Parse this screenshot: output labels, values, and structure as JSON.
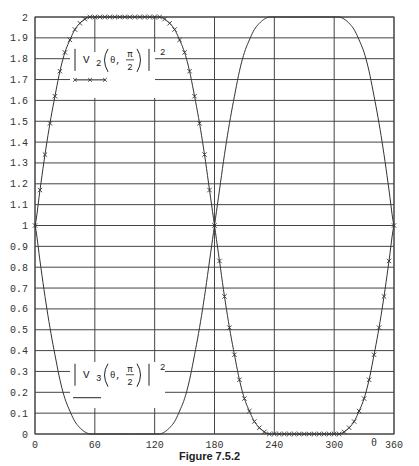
{
  "caption": "Figure 7.5.2",
  "chart_data": {
    "type": "line",
    "title": "",
    "xlabel": "θ",
    "ylabel": "",
    "xlim": [
      0,
      360
    ],
    "ylim": [
      0,
      2
    ],
    "grid": true,
    "x_ticks": [
      0,
      60,
      120,
      180,
      240,
      300,
      360
    ],
    "y_ticks": [
      0,
      0.1,
      0.2,
      0.3,
      0.4,
      0.5,
      0.6,
      0.7,
      0.8,
      0.9,
      1,
      1.1,
      1.2,
      1.3,
      1.4,
      1.5,
      1.6,
      1.7,
      1.8,
      1.9,
      2
    ],
    "x_tick_labels": [
      "0",
      "60",
      "120",
      "180",
      "240",
      "300",
      "360"
    ],
    "y_tick_labels": [
      "0",
      "0.1",
      "0.2",
      "0.3",
      "0.4",
      "0.5",
      "0.6",
      "0.7",
      "0.8",
      "0.9",
      "1",
      "1.1",
      "1.2",
      "1.3",
      "1.4",
      "1.5",
      "1.6",
      "1.7",
      "1.8",
      "1.9",
      "2"
    ],
    "x": [
      0,
      5,
      10,
      15,
      20,
      25,
      30,
      35,
      40,
      45,
      50,
      55,
      60,
      65,
      70,
      75,
      80,
      85,
      90,
      95,
      100,
      105,
      110,
      115,
      120,
      125,
      130,
      135,
      140,
      145,
      150,
      155,
      160,
      165,
      170,
      175,
      180,
      185,
      190,
      195,
      200,
      205,
      210,
      215,
      220,
      225,
      230,
      235,
      240,
      245,
      250,
      255,
      260,
      265,
      270,
      275,
      280,
      285,
      290,
      295,
      300,
      305,
      310,
      315,
      320,
      325,
      330,
      335,
      340,
      345,
      350,
      355,
      360
    ],
    "series": [
      {
        "name": "|V2(θ, π/2)|^2",
        "style": "line-with-x-markers",
        "values": [
          1.0,
          1.17,
          1.34,
          1.49,
          1.62,
          1.74,
          1.83,
          1.89,
          1.94,
          1.97,
          1.99,
          2.0,
          2.0,
          2.0,
          2.0,
          2.0,
          2.0,
          2.0,
          2.0,
          2.0,
          2.0,
          2.0,
          2.0,
          2.0,
          2.0,
          2.0,
          1.99,
          1.97,
          1.94,
          1.89,
          1.83,
          1.74,
          1.62,
          1.49,
          1.34,
          1.17,
          1.0,
          0.83,
          0.66,
          0.51,
          0.38,
          0.26,
          0.17,
          0.11,
          0.06,
          0.03,
          0.01,
          0.0,
          0.0,
          0.0,
          0.0,
          0.0,
          0.0,
          0.0,
          0.0,
          0.0,
          0.0,
          0.0,
          0.0,
          0.0,
          0.0,
          0.0,
          0.01,
          0.03,
          0.06,
          0.11,
          0.17,
          0.26,
          0.38,
          0.51,
          0.66,
          0.83,
          1.0
        ]
      },
      {
        "name": "|V3(θ, π/2)|^2",
        "style": "solid-line",
        "values": [
          1.0,
          0.83,
          0.66,
          0.51,
          0.38,
          0.26,
          0.17,
          0.11,
          0.06,
          0.03,
          0.01,
          0.0,
          0.0,
          0.0,
          0.0,
          0.0,
          0.0,
          0.0,
          0.0,
          0.0,
          0.0,
          0.0,
          0.0,
          0.0,
          0.0,
          0.0,
          0.01,
          0.03,
          0.06,
          0.11,
          0.17,
          0.26,
          0.38,
          0.51,
          0.66,
          0.83,
          1.0,
          1.17,
          1.34,
          1.49,
          1.62,
          1.74,
          1.83,
          1.89,
          1.94,
          1.97,
          1.99,
          2.0,
          2.0,
          2.0,
          2.0,
          2.0,
          2.0,
          2.0,
          2.0,
          2.0,
          2.0,
          2.0,
          2.0,
          2.0,
          2.0,
          2.0,
          1.99,
          1.97,
          1.94,
          1.89,
          1.83,
          1.74,
          1.62,
          1.49,
          1.34,
          1.17,
          1.0
        ]
      }
    ],
    "annotations": [
      {
        "series": 0,
        "text_main": "V",
        "subscript": "2",
        "arg": "θ,",
        "frac_num": "π",
        "frac_den": "2",
        "power": "2",
        "legend_line": "x-markers",
        "x_deg": 40,
        "y_val": 1.78
      },
      {
        "series": 1,
        "text_main": "V",
        "subscript": "3",
        "arg": "θ,",
        "frac_num": "π",
        "frac_den": "2",
        "power": "2",
        "legend_line": "solid",
        "x_deg": 40,
        "y_val": 0.27
      }
    ],
    "legend_position": "inline"
  }
}
